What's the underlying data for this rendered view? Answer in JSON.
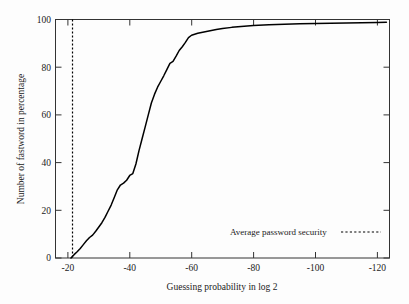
{
  "chart_data": {
    "type": "line",
    "title": "",
    "xlabel": "Guessing probability in log 2",
    "ylabel": "Number of fastword in percentage",
    "xlim": [
      -16,
      -124
    ],
    "ylim": [
      0,
      100
    ],
    "grid": false,
    "x_ticks": [
      "-20",
      "-40",
      "-60",
      "-80",
      "-100",
      "-120"
    ],
    "x_tick_values": [
      -20,
      -40,
      -60,
      -80,
      -100,
      -120
    ],
    "y_ticks": [
      "0",
      "20",
      "40",
      "60",
      "80",
      "100"
    ],
    "y_tick_values": [
      0,
      20,
      40,
      60,
      80,
      100
    ],
    "legend_position": "lower-right",
    "series": [
      {
        "name": "Cumulative password distribution",
        "style": "solid",
        "color": "#000000",
        "x": [
          -21.0,
          -22.0,
          -23.0,
          -24.0,
          -25.0,
          -26.0,
          -27.0,
          -28.0,
          -29.0,
          -30.0,
          -31.0,
          -32.0,
          -33.0,
          -34.0,
          -35.0,
          -36.0,
          -37.0,
          -38.0,
          -39.0,
          -40.0,
          -41.0,
          -42.0,
          -43.0,
          -44.0,
          -45.0,
          -46.0,
          -47.0,
          -48.0,
          -49.0,
          -50.0,
          -51.0,
          -52.0,
          -53.0,
          -54.0,
          -55.0,
          -56.0,
          -57.0,
          -58.0,
          -59.0,
          -60.0,
          -62.0,
          -64.0,
          -66.0,
          -68.0,
          -70.0,
          -73.0,
          -76.0,
          -80.0,
          -85.0,
          -90.0,
          -95.0,
          -100.0,
          -105.0,
          -110.0,
          -115.0,
          -120.0,
          -123.0
        ],
        "y": [
          0.0,
          1.4,
          2.6,
          4.0,
          5.6,
          7.2,
          8.6,
          9.6,
          11.2,
          13.0,
          14.8,
          17.0,
          19.6,
          22.2,
          25.4,
          28.6,
          30.6,
          31.4,
          32.6,
          34.6,
          35.4,
          39.4,
          45.0,
          50.0,
          55.0,
          60.0,
          65.0,
          68.6,
          71.6,
          74.0,
          76.4,
          79.0,
          81.6,
          82.4,
          84.6,
          87.0,
          88.6,
          90.4,
          92.4,
          93.4,
          94.2,
          94.8,
          95.3,
          95.8,
          96.2,
          96.7,
          97.1,
          97.5,
          97.8,
          98.0,
          98.2,
          98.3,
          98.4,
          98.5,
          98.6,
          98.7,
          98.8
        ]
      }
    ],
    "annotations": [
      {
        "name": "average-password-security",
        "label": "Average password security",
        "style": "dotted",
        "orientation": "vertical",
        "x_value": -21.5
      }
    ]
  },
  "legend": {
    "entries": [
      {
        "label": "Average password security",
        "style": "dotted"
      }
    ]
  },
  "axes": {
    "x": {
      "title": "Guessing probability in log 2",
      "tick_labels": [
        "-20",
        "-40",
        "-60",
        "-80",
        "-100",
        "-120"
      ]
    },
    "y": {
      "title": "Number of fastword in percentage",
      "tick_labels": [
        "0",
        "20",
        "40",
        "60",
        "80",
        "100"
      ]
    }
  },
  "colors": {
    "curve": "#000000",
    "frame": "#333333",
    "background": "#fdfdfd",
    "text": "#1a1a1a"
  }
}
